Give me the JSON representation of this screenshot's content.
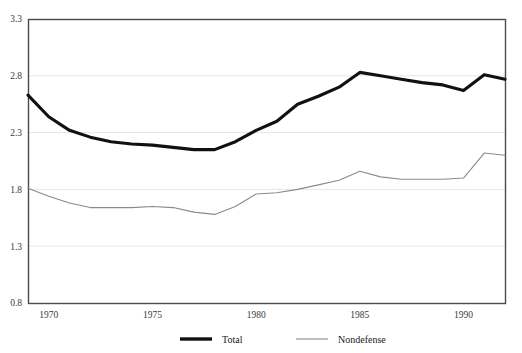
{
  "chart_data": {
    "type": "line",
    "title": "",
    "xlabel": "",
    "ylabel": "",
    "xlim": [
      1969,
      1992
    ],
    "ylim": [
      0.8,
      3.3
    ],
    "grid": true,
    "yticks": [
      "3.3",
      "2.8",
      "2.3",
      "1.8",
      "1.3",
      "0.8"
    ],
    "ytick_values": [
      3.3,
      2.8,
      2.3,
      1.8,
      1.3,
      0.8
    ],
    "xticks": [
      "1970",
      "1975",
      "1980",
      "1985",
      "1990"
    ],
    "xtick_values": [
      1970,
      1975,
      1980,
      1985,
      1990
    ],
    "legend_position": "bottom",
    "x": [
      1969,
      1970,
      1971,
      1972,
      1973,
      1974,
      1975,
      1976,
      1977,
      1978,
      1979,
      1980,
      1981,
      1982,
      1983,
      1984,
      1985,
      1986,
      1987,
      1988,
      1989,
      1990,
      1991,
      1992
    ],
    "series": [
      {
        "name": "Total",
        "color": "#111111",
        "width": "thick",
        "values": [
          2.63,
          2.44,
          2.32,
          2.26,
          2.22,
          2.2,
          2.19,
          2.17,
          2.15,
          2.15,
          2.22,
          2.32,
          2.4,
          2.55,
          2.62,
          2.7,
          2.83,
          2.8,
          2.77,
          2.74,
          2.72,
          2.67,
          2.81,
          2.77
        ]
      },
      {
        "name": "Nondefense",
        "color": "#8a8a8a",
        "width": "thin",
        "values": [
          1.81,
          1.74,
          1.68,
          1.64,
          1.64,
          1.64,
          1.65,
          1.64,
          1.6,
          1.58,
          1.65,
          1.76,
          1.77,
          1.8,
          1.84,
          1.88,
          1.96,
          1.91,
          1.89,
          1.89,
          1.89,
          1.9,
          2.12,
          2.1
        ]
      }
    ]
  },
  "legend": {
    "items": [
      {
        "label": "Total"
      },
      {
        "label": "Nondefense"
      }
    ]
  },
  "colors": {
    "total": "#111111",
    "nondefense": "#8a8a8a",
    "grid": "#e6e6e6",
    "frame": "#4a4a4a",
    "background": "#ffffff"
  }
}
